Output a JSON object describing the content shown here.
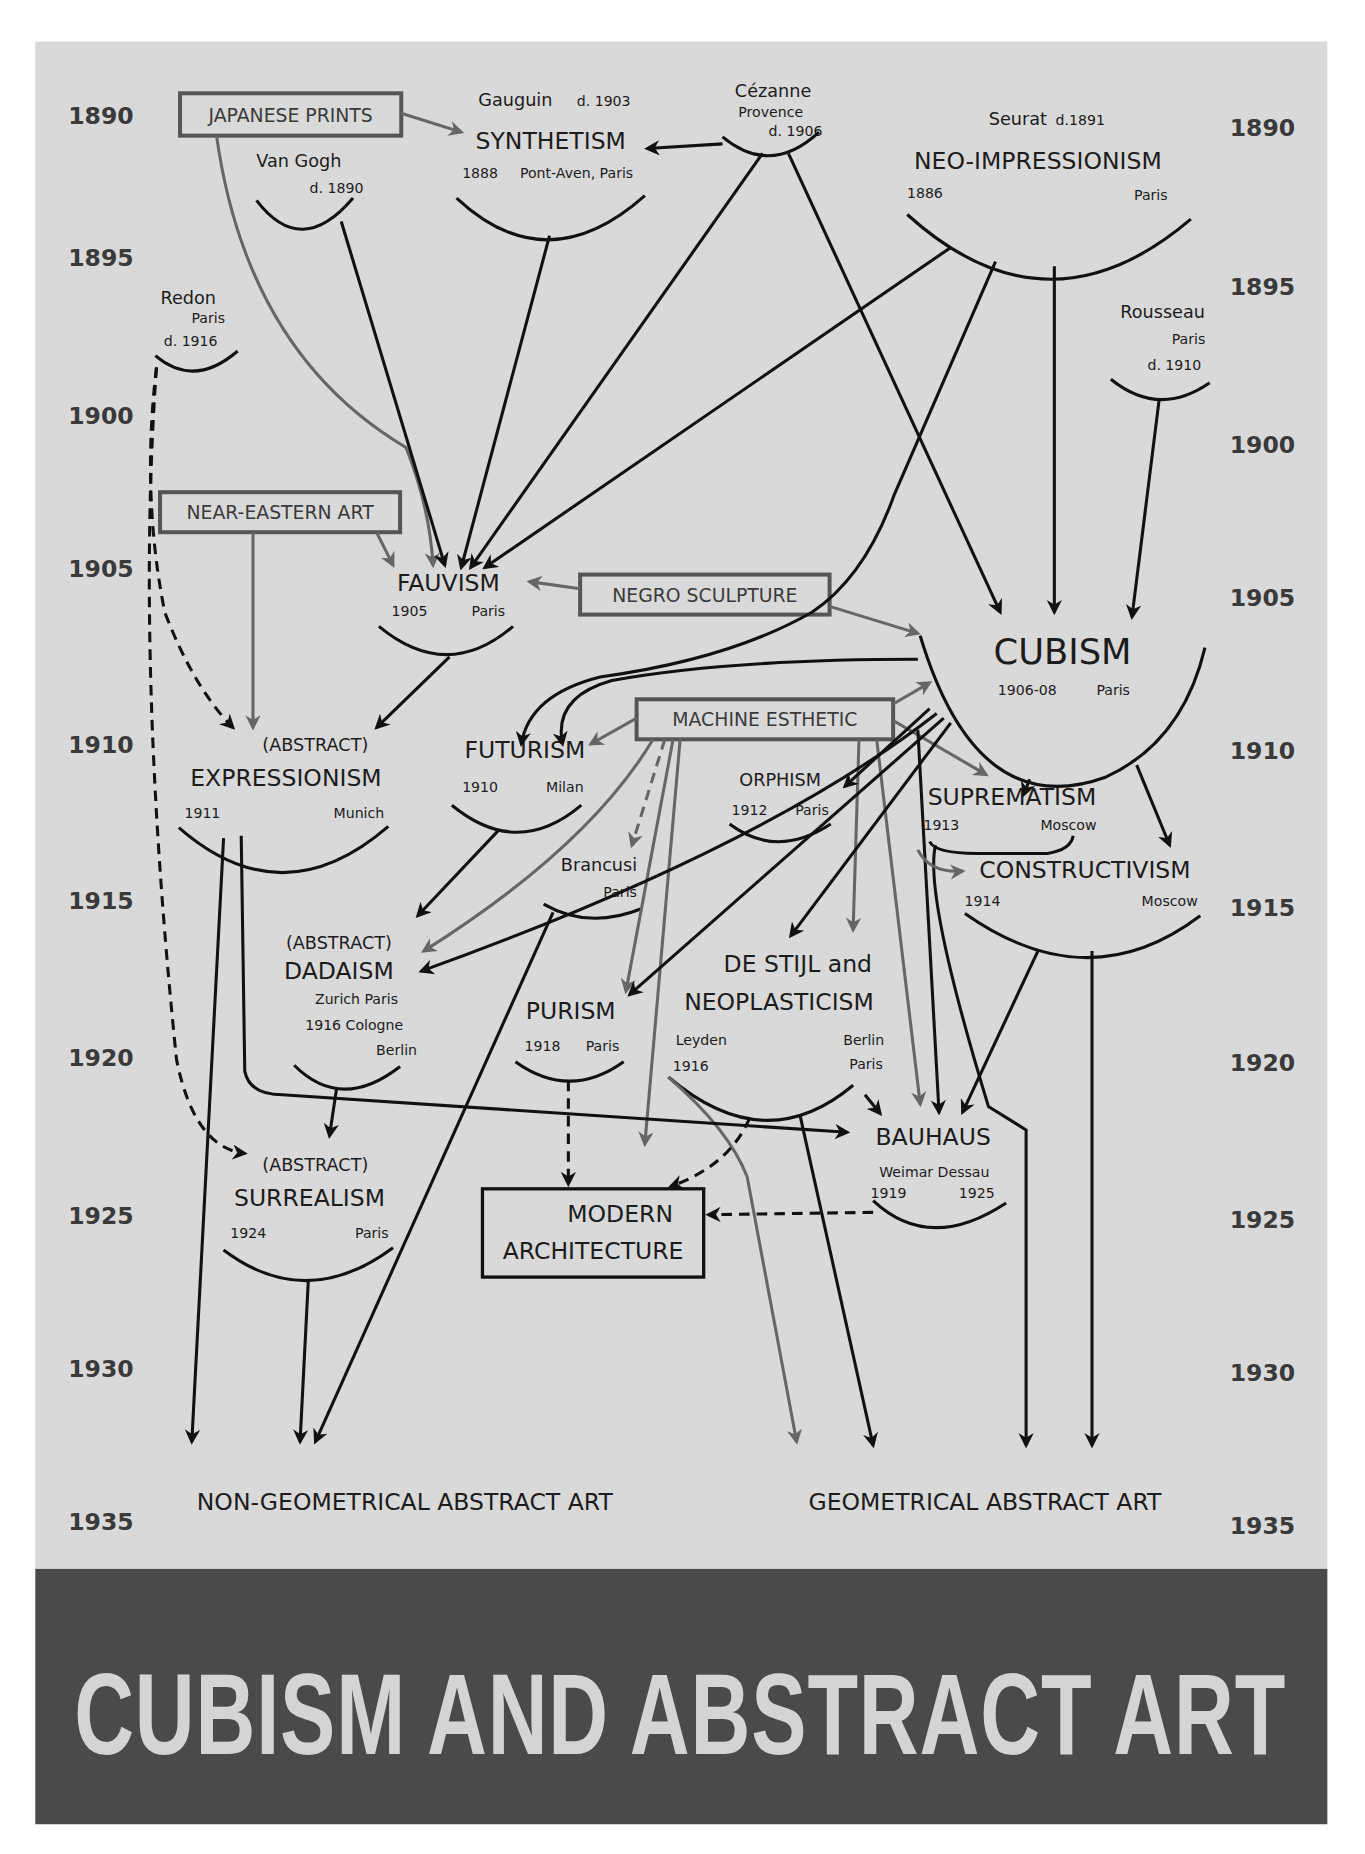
{
  "page": {
    "background": "#ffffff",
    "poster_bg": "#d9d9d9",
    "band_bg": "#4a4a4a",
    "title_color": "#d4d4d4"
  },
  "years_left": [
    "1890",
    "1895",
    "1900",
    "1905",
    "1910",
    "1915",
    "1920",
    "1925",
    "1930",
    "1935"
  ],
  "years_right": [
    "1890",
    "1895",
    "1900",
    "1905",
    "1910",
    "1915",
    "1920",
    "1925",
    "1930",
    "1935"
  ],
  "influences": {
    "japanese_prints": "JAPANESE PRINTS",
    "near_eastern_art": "NEAR-EASTERN ART",
    "negro_sculpture": "NEGRO SCULPTURE",
    "machine_esthetic": "MACHINE ESTHETIC"
  },
  "artists": {
    "van_gogh": {
      "name": "Van Gogh",
      "note": "d. 1890"
    },
    "gauguin": {
      "name": "Gauguin",
      "note": "d. 1903"
    },
    "cezanne": {
      "name": "Cézanne",
      "place": "Provence",
      "note": "d. 1906"
    },
    "seurat": {
      "name": "Seurat",
      "note": "d.1891"
    },
    "redon": {
      "name": "Redon",
      "place": "Paris",
      "note": "d. 1916"
    },
    "rousseau": {
      "name": "Rousseau",
      "place": "Paris",
      "note": "d. 1910"
    },
    "brancusi": {
      "name": "Brancusi",
      "place": "Paris"
    }
  },
  "movements": {
    "synthetism": {
      "name": "SYNTHETISM",
      "year": "1888",
      "place": "Pont-Aven, Paris"
    },
    "neo_impressionism": {
      "name": "NEO-IMPRESSIONISM",
      "year": "1886",
      "place": "Paris"
    },
    "fauvism": {
      "name": "FAUVISM",
      "year": "1905",
      "place": "Paris"
    },
    "cubism": {
      "name": "CUBISM",
      "year": "1906-08",
      "place": "Paris"
    },
    "expressionism": {
      "prefix": "(ABSTRACT)",
      "name": "EXPRESSIONISM",
      "year": "1911",
      "place": "Munich"
    },
    "futurism": {
      "name": "FUTURISM",
      "year": "1910",
      "place": "Milan"
    },
    "orphism": {
      "name": "ORPHISM",
      "year": "1912",
      "place": "Paris"
    },
    "suprematism": {
      "name": "SUPREMATISM",
      "year": "1913",
      "place": "Moscow"
    },
    "constructivism": {
      "name": "CONSTRUCTIVISM",
      "year": "1914",
      "place": "Moscow"
    },
    "dadaism": {
      "prefix": "(ABSTRACT)",
      "name": "DADAISM",
      "places1": "Zurich    Paris",
      "places2": "1916   Cologne",
      "places3": "Berlin"
    },
    "purism": {
      "name": "PURISM",
      "year": "1918",
      "place": "Paris"
    },
    "de_stijl": {
      "line1": "DE STIJL and",
      "line2": "NEOPLASTICISM",
      "place1": "Leyden",
      "year": "1916",
      "place2": "Berlin",
      "place3": "Paris"
    },
    "bauhaus": {
      "name": "BAUHAUS",
      "places": "Weimar  Dessau",
      "year1": "1919",
      "year2": "1925"
    },
    "surrealism": {
      "prefix": "(ABSTRACT)",
      "name": "SURREALISM",
      "year": "1924",
      "place": "Paris"
    },
    "modern_architecture": {
      "line1": "MODERN",
      "line2": "ARCHITECTURE"
    }
  },
  "outcomes": {
    "non_geometrical": "NON-GEOMETRICAL ABSTRACT ART",
    "geometrical": "GEOMETRICAL ABSTRACT ART"
  },
  "title": "CUBISM AND ABSTRACT ART"
}
